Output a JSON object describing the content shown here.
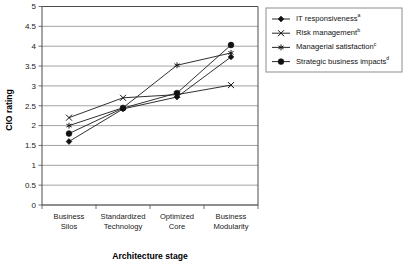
{
  "chart_data": {
    "type": "line",
    "title": "",
    "xlabel": "Architecture stage",
    "ylabel": "CIO rating",
    "categories": [
      "Business Silos",
      "Standardized Technology",
      "Optimized Core",
      "Business Modularity"
    ],
    "category_lines": [
      [
        "Business",
        "Silos"
      ],
      [
        "Standardized",
        "Technology"
      ],
      [
        "Optimized",
        "Core"
      ],
      [
        "Business",
        "Modularity"
      ]
    ],
    "ylim": [
      0,
      5
    ],
    "yticks": [
      "0",
      "0.5",
      "1",
      "1.5",
      "2",
      "2.5",
      "3",
      "3.5",
      "4",
      "4.5",
      "5"
    ],
    "ytick_values": [
      0,
      0.5,
      1,
      1.5,
      2,
      2.5,
      3,
      3.5,
      4,
      4.5,
      5
    ],
    "grid": "horizontal",
    "legend_position": "right-top",
    "series": [
      {
        "name": "IT responsiveness",
        "superscript": "a",
        "marker": "diamond",
        "values": [
          1.6,
          2.42,
          2.72,
          3.73
        ]
      },
      {
        "name": "Risk management",
        "superscript": "b",
        "marker": "cross",
        "values": [
          2.2,
          2.7,
          2.78,
          3.02
        ]
      },
      {
        "name": "Managerial satisfaction",
        "superscript": "c",
        "marker": "asterisk",
        "values": [
          2.0,
          2.45,
          3.52,
          3.83
        ]
      },
      {
        "name": "Strategic business impacts",
        "superscript": "d",
        "marker": "circle",
        "values": [
          1.8,
          2.44,
          2.82,
          4.03
        ]
      }
    ]
  },
  "colors": {
    "series": "#111111",
    "grid": "#8c8c8c",
    "axis": "#4d4d4d",
    "background": "#ffffff"
  }
}
